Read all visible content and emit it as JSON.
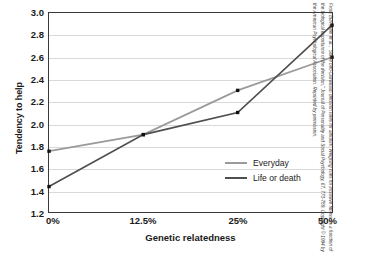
{
  "chart_data": {
    "type": "line",
    "title": "",
    "xlabel": "Genetic relatedness",
    "ylabel": "Tendency to help",
    "categories": [
      "0%",
      "12.5%",
      "25%",
      "50%"
    ],
    "ylim": [
      1.2,
      3.0
    ],
    "ytick_step": 0.2,
    "yticks": [
      "3.0",
      "2.8",
      "2.6",
      "2.4",
      "2.2",
      "2.0",
      "1.8",
      "1.6",
      "1.4",
      "1.2"
    ],
    "ytick_values": [
      3.0,
      2.8,
      2.6,
      2.4,
      2.2,
      2.0,
      1.8,
      1.6,
      1.4,
      1.2
    ],
    "grid": true,
    "grid_axis": "y",
    "legend_position": "inside-bottom-right",
    "markers": "square",
    "series": [
      {
        "name": "Everyday",
        "values": [
          1.75,
          1.9,
          2.3,
          2.6
        ],
        "color": "#9a9a9a"
      },
      {
        "name": "Life or death",
        "values": [
          1.43,
          1.9,
          2.1,
          2.89
        ],
        "color": "#4f4f4f"
      }
    ]
  },
  "legend": {
    "items": [
      {
        "label": "Everyday"
      },
      {
        "label": "Life or death"
      }
    ]
  },
  "credit": {
    "text": "From Burnstein et al., “Some neo-Darwinian decision rules for altruism: Weighing cues for inclusive fitness as a function of the biological importance of the decision,” Journal of Personality and Social Psychology, 67, 773-789. Copyright © 1994 by the American Psychological Association. Reprinted by permission."
  },
  "colors": {
    "everyday": "#9a9a9a",
    "life_or_death": "#4f4f4f",
    "gridline": "#d9d9d9",
    "frame": "#3a3a3a",
    "text": "#1a1a1a"
  }
}
